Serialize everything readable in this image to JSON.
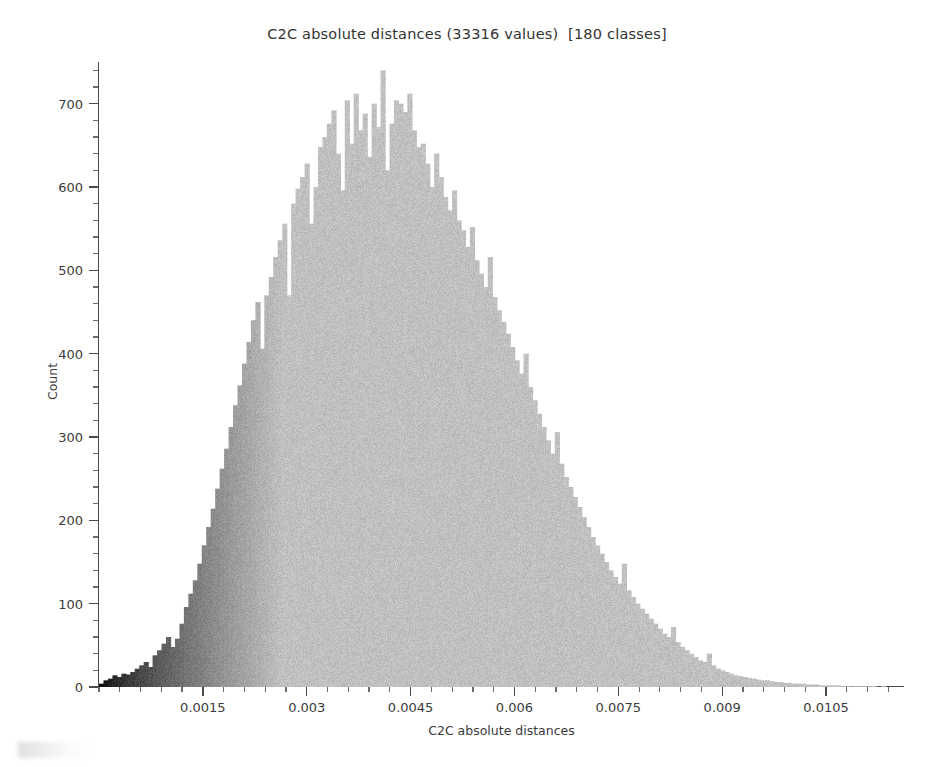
{
  "chart_data": {
    "type": "bar",
    "title": "C2C absolute distances (33316 values)  [180 classes]",
    "xlabel": "C2C absolute distances",
    "ylabel": "Count",
    "n_values": 33316,
    "n_classes": 180,
    "grid": false,
    "legend": null,
    "xlim": [
      0.0,
      0.011625
    ],
    "ylim": [
      0,
      750
    ],
    "bin_width": 6.4583e-05,
    "x_ticks": [
      0.0015,
      0.003,
      0.0045,
      0.006,
      0.0075,
      0.009,
      0.0105
    ],
    "x_tick_labels": [
      "0.0015",
      "0.003",
      "0.0045",
      "0.006",
      "0.0075",
      "0.009",
      "0.0105"
    ],
    "x_minor_step": 0.0003,
    "y_ticks": [
      0,
      100,
      200,
      300,
      400,
      500,
      600,
      700
    ],
    "y_tick_labels": [
      "0",
      "100",
      "200",
      "300",
      "400",
      "500",
      "600",
      "700"
    ],
    "y_minor_step": 20,
    "bar_color_start": "#0a0a0a",
    "bar_color_end": "#c0c0c0",
    "axis_color": "#4a4a4a",
    "background": "#ffffff",
    "categories": [
      3.2e-05,
      9.7e-05,
      0.000161,
      0.000226,
      0.00029,
      0.000355,
      0.000419,
      0.000484,
      0.000548,
      0.000613,
      0.000677,
      0.000742,
      0.000806,
      0.000871,
      0.000935,
      0.001,
      0.001065,
      0.001129,
      0.001194,
      0.001258,
      0.001323,
      0.001387,
      0.001452,
      0.001516,
      0.001581,
      0.001645,
      0.00171,
      0.001774,
      0.001839,
      0.001903,
      0.001968,
      0.002033,
      0.002097,
      0.002162,
      0.002226,
      0.002291,
      0.002355,
      0.00242,
      0.002484,
      0.002549,
      0.002613,
      0.002678,
      0.002742,
      0.002807,
      0.002871,
      0.002936,
      0.003001,
      0.003065,
      0.00313,
      0.003194,
      0.003259,
      0.003323,
      0.003388,
      0.003452,
      0.003517,
      0.003581,
      0.003646,
      0.00371,
      0.003775,
      0.003839,
      0.003904,
      0.003969,
      0.004033,
      0.004098,
      0.004162,
      0.004227,
      0.004291,
      0.004356,
      0.00442,
      0.004485,
      0.004549,
      0.004614,
      0.004678,
      0.004743,
      0.004807,
      0.004872,
      0.004937,
      0.005001,
      0.005066,
      0.00513,
      0.005195,
      0.005259,
      0.005324,
      0.005388,
      0.005453,
      0.005517,
      0.005582,
      0.005646,
      0.005711,
      0.005775,
      0.00584,
      0.005905,
      0.005969,
      0.006034,
      0.006098,
      0.006163,
      0.006227,
      0.006292,
      0.006356,
      0.006421,
      0.006485,
      0.00655,
      0.006614,
      0.006679,
      0.006743,
      0.006808,
      0.006873,
      0.006937,
      0.007002,
      0.007066,
      0.007131,
      0.007195,
      0.00726,
      0.007324,
      0.007389,
      0.007453,
      0.007518,
      0.007582,
      0.007647,
      0.007711,
      0.007776,
      0.007841,
      0.007905,
      0.00797,
      0.008034,
      0.008099,
      0.008163,
      0.008228,
      0.008292,
      0.008357,
      0.008421,
      0.008486,
      0.00855,
      0.008615,
      0.008679,
      0.008744,
      0.008809,
      0.008873,
      0.008938,
      0.009002,
      0.009067,
      0.009131,
      0.009196,
      0.00926,
      0.009325,
      0.009389,
      0.009454,
      0.009518,
      0.009583,
      0.009647,
      0.009712,
      0.009777,
      0.009841,
      0.009906,
      0.00997,
      0.010035,
      0.010099,
      0.010164,
      0.010228,
      0.010293,
      0.010357,
      0.010422,
      0.010486,
      0.010551,
      0.010615,
      0.01068,
      0.010745,
      0.010809,
      0.010874,
      0.010938,
      0.011003,
      0.011067,
      0.011132,
      0.011196,
      0.011261,
      0.011325,
      0.01139,
      0.011454,
      0.011519,
      0.011583
    ],
    "values": [
      4,
      8,
      10,
      14,
      12,
      16,
      15,
      18,
      22,
      26,
      30,
      24,
      38,
      44,
      52,
      60,
      48,
      58,
      76,
      96,
      112,
      128,
      148,
      170,
      192,
      214,
      238,
      262,
      286,
      312,
      338,
      362,
      388,
      414,
      440,
      462,
      406,
      470,
      492,
      516,
      536,
      556,
      470,
      580,
      598,
      612,
      628,
      556,
      600,
      648,
      660,
      676,
      692,
      640,
      596,
      704,
      652,
      712,
      668,
      688,
      636,
      700,
      672,
      740,
      620,
      676,
      704,
      700,
      690,
      712,
      668,
      648,
      652,
      628,
      600,
      640,
      612,
      588,
      572,
      596,
      560,
      548,
      528,
      552,
      512,
      496,
      480,
      516,
      468,
      452,
      438,
      424,
      408,
      392,
      376,
      400,
      360,
      344,
      328,
      312,
      296,
      280,
      306,
      268,
      252,
      240,
      228,
      216,
      204,
      192,
      180,
      170,
      160,
      150,
      140,
      132,
      124,
      148,
      116,
      108,
      100,
      94,
      88,
      82,
      76,
      70,
      64,
      60,
      72,
      54,
      48,
      44,
      40,
      36,
      32,
      30,
      40,
      26,
      22,
      20,
      18,
      16,
      14,
      13,
      12,
      11,
      10,
      9,
      8,
      8,
      7,
      6,
      6,
      5,
      5,
      4,
      4,
      4,
      3,
      3,
      3,
      2,
      2,
      2,
      2,
      2,
      1,
      1,
      1,
      1,
      1,
      1,
      1,
      1,
      0,
      1,
      0,
      0,
      0,
      0
    ]
  },
  "axes": {
    "y_label": "Count",
    "x_label": "C2C absolute distances"
  }
}
